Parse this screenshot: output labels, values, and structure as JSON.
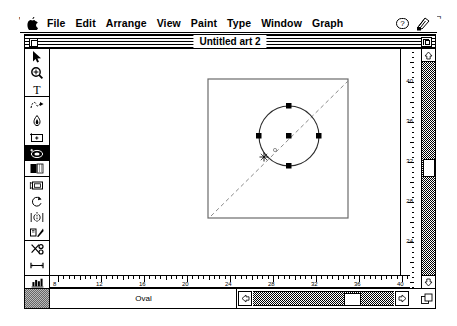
{
  "app": {
    "window_title": "Untitled art 2",
    "status_tool": "Oval"
  },
  "menubar": {
    "apple_icon": "apple-icon",
    "items": [
      {
        "label": "File"
      },
      {
        "label": "Edit"
      },
      {
        "label": "Arrange"
      },
      {
        "label": "View"
      },
      {
        "label": "Paint"
      },
      {
        "label": "Type"
      },
      {
        "label": "Window"
      },
      {
        "label": "Graph"
      }
    ],
    "right_icons": [
      {
        "name": "help-icon",
        "label": "?"
      },
      {
        "name": "application-icon",
        "label": ""
      }
    ]
  },
  "titlebar": {
    "close_label": "",
    "zoom_label": ""
  },
  "toolbar": {
    "tools": [
      {
        "name": "pointer-tool",
        "label": "Pointer",
        "active": false
      },
      {
        "name": "zoom-tool",
        "label": "Zoom",
        "active": false
      },
      {
        "name": "text-tool",
        "label": "Text",
        "active": false
      },
      {
        "name": "freehand-tool",
        "label": "Freehand",
        "active": false
      },
      {
        "name": "eyedropper-tool",
        "label": "Eyedropper",
        "active": false
      },
      {
        "name": "rectangle-tool",
        "label": "Rectangle",
        "active": false
      },
      {
        "name": "oval-tool",
        "label": "Oval",
        "active": true
      },
      {
        "name": "pattern-tool",
        "label": "Pattern",
        "active": false
      },
      {
        "name": "frame-tool",
        "label": "Frame",
        "active": false
      },
      {
        "name": "rotate-tool",
        "label": "Rotate",
        "active": false
      },
      {
        "name": "reflect-tool",
        "label": "Reflect",
        "active": false
      },
      {
        "name": "shear-tool",
        "label": "Shear",
        "active": false
      },
      {
        "name": "scissors-tool",
        "label": "Scissors",
        "active": false
      },
      {
        "name": "measure-tool",
        "label": "Measure",
        "active": false
      },
      {
        "name": "page-tool",
        "label": "Page",
        "active": false
      },
      {
        "name": "graph-tool",
        "label": "Graph",
        "active": false
      }
    ]
  },
  "rulers": {
    "horizontal": {
      "labels": [
        "8",
        "12",
        "16",
        "20",
        "24",
        "28",
        "32",
        "36",
        "40",
        "44"
      ],
      "start_px": 8,
      "spacing_px": 43
    },
    "vertical": {
      "labels": [
        "40",
        "36",
        "32",
        "28",
        "24"
      ],
      "start_px": 33,
      "spacing_px": 40
    }
  },
  "canvas": {
    "artboard": {
      "x": 158,
      "y": 30,
      "width": 140,
      "height": 139
    },
    "oval": {
      "cx": 239,
      "cy": 87,
      "r": 30
    },
    "handles": [
      {
        "name": "handle-top",
        "x": 239,
        "y": 57
      },
      {
        "name": "handle-right",
        "x": 269,
        "y": 87
      },
      {
        "name": "handle-bottom",
        "x": 239,
        "y": 117
      },
      {
        "name": "handle-left",
        "x": 209,
        "y": 87
      },
      {
        "name": "handle-center",
        "x": 239,
        "y": 87
      }
    ],
    "guide_line": {
      "x1": 161,
      "y1": 167,
      "x2": 298,
      "y2": 32
    },
    "cursor": {
      "x": 214,
      "y": 108
    }
  },
  "scrollbars": {
    "vertical_thumb_top": 110,
    "horizontal_thumb_left": 91,
    "up_arrow": "▲",
    "down_arrow": "▼",
    "left_arrow": "◄",
    "right_arrow": "►"
  }
}
